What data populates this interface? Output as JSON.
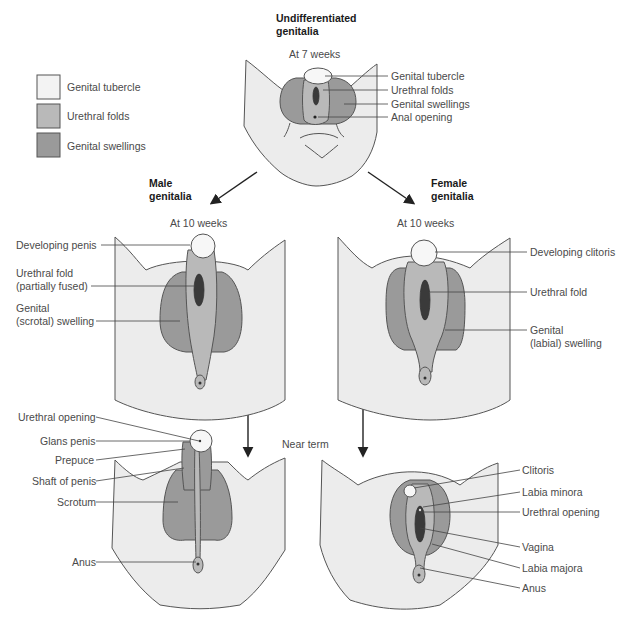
{
  "legend": {
    "items": [
      {
        "label": "Genital tubercle",
        "color": "#f3f3f3"
      },
      {
        "label": "Urethral folds",
        "color": "#b9b9b9"
      },
      {
        "label": "Genital swellings",
        "color": "#9a9a9a"
      }
    ]
  },
  "undifferentiated": {
    "title_line1": "Undifferentiated",
    "title_line2": "genitalia",
    "stage": "At 7 weeks",
    "labels": [
      "Genital tubercle",
      "Urethral folds",
      "Genital swellings",
      "Anal opening"
    ]
  },
  "male": {
    "title_line1": "Male",
    "title_line2": "genitalia",
    "stage_10wk": "At 10 weeks",
    "labels_10wk": [
      {
        "line1": "Developing penis",
        "line2": ""
      },
      {
        "line1": "Urethral fold",
        "line2": "(partially fused)"
      },
      {
        "line1": "Genital",
        "line2": "(scrotal) swelling"
      }
    ],
    "labels_term": [
      "Urethral opening",
      "Glans penis",
      "Prepuce",
      "Shaft of penis",
      "Scrotum",
      "Anus"
    ]
  },
  "female": {
    "title_line1": "Female",
    "title_line2": "genitalia",
    "stage_10wk": "At 10 weeks",
    "labels_10wk": [
      {
        "line1": "Developing clitoris",
        "line2": ""
      },
      {
        "line1": "Urethral fold",
        "line2": ""
      },
      {
        "line1": "Genital",
        "line2": "(labial) swelling"
      }
    ],
    "labels_term": [
      "Clitoris",
      "Labia minora",
      "Urethral opening",
      "Vagina",
      "Labia majora",
      "Anus"
    ]
  },
  "near_term_label": "Near term",
  "colors": {
    "tubercle": "#f3f3f3",
    "folds": "#b9b9b9",
    "swellings": "#9a9a9a",
    "skin": "#ececec"
  }
}
